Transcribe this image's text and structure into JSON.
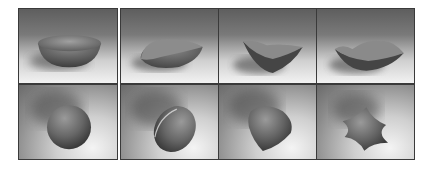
{
  "figure": {
    "columns": 4,
    "rows": 2,
    "panels": [
      {
        "row": 0,
        "col": 0,
        "shape": "bowl-round"
      },
      {
        "row": 0,
        "col": 1,
        "shape": "bowl-tilted"
      },
      {
        "row": 0,
        "col": 2,
        "shape": "bowl-triangular-warped"
      },
      {
        "row": 0,
        "col": 3,
        "shape": "bowl-wavy-rim"
      },
      {
        "row": 1,
        "col": 0,
        "shape": "sphere"
      },
      {
        "row": 1,
        "col": 1,
        "shape": "ellipsoid"
      },
      {
        "row": 1,
        "col": 2,
        "shape": "rounded-tetrahedron"
      },
      {
        "row": 1,
        "col": 3,
        "shape": "four-lobed-blob"
      }
    ],
    "colors": {
      "frame": "#3a3a3a",
      "object": "#6a6a6a",
      "background_dark": "#5e5e5e",
      "background_light": "#f2f2f2"
    }
  }
}
